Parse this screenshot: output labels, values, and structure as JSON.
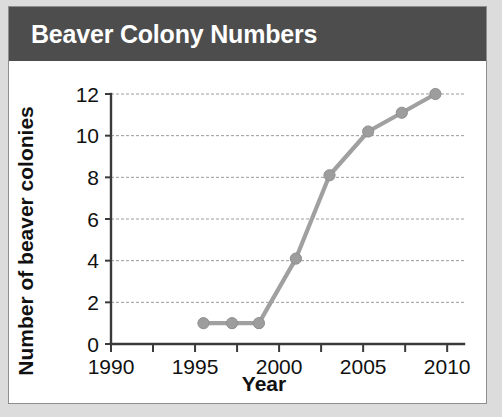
{
  "card": {
    "title": "Beaver Colony Numbers"
  },
  "chart_data": {
    "type": "line",
    "title": "Beaver Colony Numbers",
    "xlabel": "Year",
    "ylabel": "Number of beaver colonies",
    "xlim": [
      1990,
      2011
    ],
    "ylim": [
      0,
      12
    ],
    "xticks": [
      1990,
      1995,
      2000,
      2005,
      2010
    ],
    "xtick_labels": [
      "1990",
      "1995",
      "2000",
      "2005",
      "2010"
    ],
    "x_minor_tick_interval": 2.5,
    "yticks": [
      0,
      2,
      4,
      6,
      8,
      10,
      12
    ],
    "ytick_labels": [
      "0",
      "2",
      "4",
      "6",
      "8",
      "10",
      "12"
    ],
    "grid": "horizontal-dashed",
    "legend": "none",
    "marker": "circle",
    "line_color": "#a0a0a0",
    "marker_color": "#9d9d9d",
    "series": [
      {
        "name": "Beaver colonies",
        "x": [
          1995.5,
          1997.2,
          1998.8,
          2001.0,
          2003.0,
          2005.3,
          2007.3,
          2009.3
        ],
        "values": [
          1.0,
          1.0,
          1.0,
          4.1,
          8.1,
          10.2,
          11.1,
          12.0
        ]
      }
    ]
  }
}
